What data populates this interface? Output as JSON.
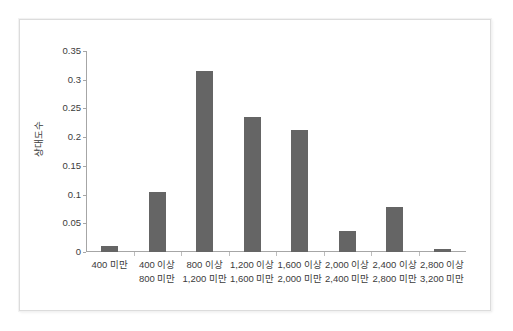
{
  "chart_data": {
    "type": "bar",
    "title": "",
    "subtitle": "",
    "xlabel": "",
    "ylabel": "상대도수",
    "ylim": [
      0,
      0.35
    ],
    "grid": false,
    "legend": null,
    "bar_color": "#656565",
    "categories": [
      "400 미만",
      "400 이상\n800 미만",
      "800 이상\n1,200 미만",
      "1,200 이상\n1,600 미만",
      "1,600 이상\n2,000 미만",
      "2,000 이상\n2,400 미만",
      "2,400 이상\n2,800 미만",
      "2,800 이상\n3,200 미만"
    ],
    "category_lines": [
      {
        "line1": "400 미만",
        "line2": ""
      },
      {
        "line1": "400 이상",
        "line2": "800 미만"
      },
      {
        "line1": "800 이상",
        "line2": "1,200 미만"
      },
      {
        "line1": "1,200 이상",
        "line2": "1,600 미만"
      },
      {
        "line1": "1,600 이상",
        "line2": "2,000 미만"
      },
      {
        "line1": "2,000 이상",
        "line2": "2,400 미만"
      },
      {
        "line1": "2,400 이상",
        "line2": "2,800 미만"
      },
      {
        "line1": "2,800 이상",
        "line2": "3,200 미만"
      }
    ],
    "values": [
      0.01,
      0.105,
      0.315,
      0.235,
      0.212,
      0.036,
      0.078,
      0.005
    ],
    "ytick_labels": [
      "0.35",
      "0.3",
      "0.25",
      "0.2",
      "0.15",
      "0.1",
      "0.05",
      "0"
    ],
    "ytick_values": [
      0.35,
      0.3,
      0.25,
      0.2,
      0.15,
      0.1,
      0.05,
      0
    ]
  }
}
